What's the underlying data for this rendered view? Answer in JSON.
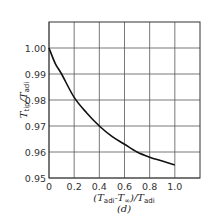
{
  "chart_data": {
    "type": "line",
    "title": "",
    "panel_label": "(d)",
    "xlabel": "(T_adi - T_∞)/T_adi",
    "ylabel": "T_tip/T_adi",
    "x_ticks": [
      "0",
      "0.2",
      "0.4",
      "0.6",
      "0.8",
      "1.0"
    ],
    "y_ticks": [
      "0.95",
      "0.96",
      "0.97",
      "0.98",
      "0.99",
      "1.00"
    ],
    "xlim": [
      0,
      1.2
    ],
    "ylim": [
      0.95,
      1.01
    ],
    "grid": true,
    "legend": null,
    "series": [
      {
        "name": "T_tip/T_adi",
        "x": [
          0,
          0.05,
          0.1,
          0.2,
          0.3,
          0.4,
          0.5,
          0.6,
          0.7,
          0.8,
          0.9,
          1.0
        ],
        "y": [
          1.0,
          0.994,
          0.99,
          0.981,
          0.975,
          0.97,
          0.966,
          0.963,
          0.96,
          0.958,
          0.9565,
          0.955
        ]
      }
    ]
  },
  "labels": {
    "y_main": "T",
    "y_sub1": "tip",
    "y_mid": "/T",
    "y_sub2": "adi",
    "x_open": "(T",
    "x_sub1": "adi",
    "x_minus": "-T",
    "x_sub2": "∞",
    "x_close": ")/T",
    "x_sub3": "adi",
    "panel": "(d)"
  }
}
